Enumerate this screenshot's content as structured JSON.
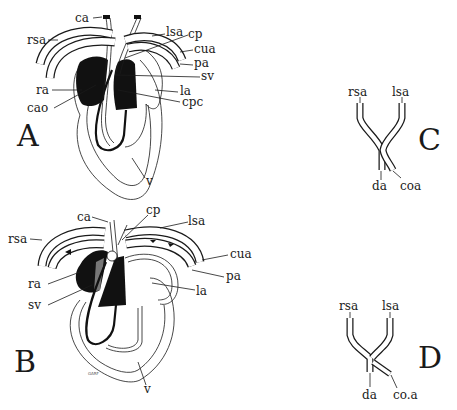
{
  "figure": {
    "panels": [
      {
        "id": "A",
        "letter": "A",
        "labels": {
          "ca": "ca",
          "rsa": "rsa",
          "lsa": "lsa",
          "cp": "cp",
          "cua": "cua",
          "pa": "pa",
          "sv": "sv",
          "ra": "ra",
          "la": "la",
          "cao": "cao",
          "cpc": "cpc",
          "v": "v"
        }
      },
      {
        "id": "B",
        "letter": "B",
        "labels": {
          "ca": "ca",
          "cp": "cp",
          "lsa": "lsa",
          "rsa": "rsa",
          "cua": "cua",
          "pa": "pa",
          "ra": "ra",
          "la": "la",
          "sv": "sv",
          "v": "v"
        },
        "signature": "GARF"
      },
      {
        "id": "C",
        "letter": "C",
        "labels": {
          "rsa": "rsa",
          "lsa": "lsa",
          "da": "da",
          "coa": "coa"
        }
      },
      {
        "id": "D",
        "letter": "D",
        "labels": {
          "rsa": "rsa",
          "lsa": "lsa",
          "da": "da",
          "coa": "co.a"
        }
      }
    ]
  }
}
